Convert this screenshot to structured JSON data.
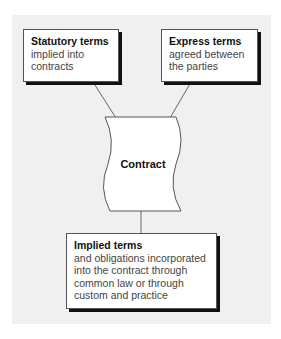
{
  "diagram": {
    "nodes": {
      "statutory": {
        "title": "Statutory terms",
        "body": "implied into\ncontracts"
      },
      "express": {
        "title": "Express terms",
        "body": "agreed between\nthe parties"
      },
      "contract": {
        "label": "Contract"
      },
      "implied": {
        "title": "Implied terms",
        "body": "and obligations incorporated\ninto the contract through\ncommon law or through\ncustom and practice"
      }
    },
    "edges": [
      {
        "from": "statutory",
        "to": "contract"
      },
      {
        "from": "express",
        "to": "contract"
      },
      {
        "from": "contract",
        "to": "implied"
      }
    ],
    "colors": {
      "background": "#f0f0f0",
      "box": "#ffffff",
      "shadow": "#111111",
      "line": "#555555"
    }
  }
}
